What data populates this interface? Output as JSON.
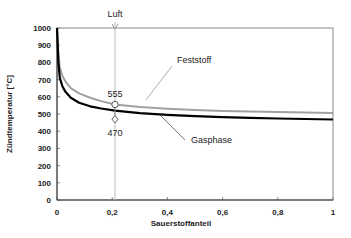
{
  "chart_data": {
    "type": "line",
    "title": "",
    "xlabel": "Sauerstoffanteil",
    "ylabel": "Zündtemperatur [°C]",
    "xlim": [
      0,
      1
    ],
    "ylim": [
      0,
      1000
    ],
    "x_ticks": [
      "0",
      "0,2",
      "0,4",
      "0,6",
      "0,8",
      "1"
    ],
    "y_ticks": [
      "0",
      "100",
      "200",
      "300",
      "400",
      "500",
      "600",
      "700",
      "800",
      "900",
      "1000"
    ],
    "grid": false,
    "series": [
      {
        "name": "Feststoff",
        "color": "#a0a0a0",
        "x": [
          0,
          0.005,
          0.01,
          0.02,
          0.03,
          0.05,
          0.08,
          0.12,
          0.16,
          0.21,
          0.3,
          0.4,
          0.5,
          0.6,
          0.7,
          0.8,
          0.9,
          1.0
        ],
        "y": [
          1000,
          850,
          770,
          720,
          690,
          650,
          620,
          595,
          575,
          555,
          540,
          530,
          523,
          518,
          514,
          511,
          508,
          505
        ]
      },
      {
        "name": "Gasphase",
        "color": "#000000",
        "x": [
          0,
          0.005,
          0.01,
          0.02,
          0.03,
          0.05,
          0.08,
          0.12,
          0.16,
          0.21,
          0.3,
          0.4,
          0.5,
          0.6,
          0.7,
          0.8,
          0.9,
          1.0
        ],
        "y": [
          1000,
          800,
          710,
          660,
          630,
          595,
          565,
          545,
          532,
          520,
          505,
          495,
          488,
          482,
          478,
          474,
          471,
          468
        ]
      }
    ],
    "annotations": [
      {
        "text": "Luft",
        "x": 0.21,
        "type": "vertical-line"
      },
      {
        "text": "555",
        "x": 0.21,
        "y": 555,
        "marker": "circle"
      },
      {
        "text": "470",
        "x": 0.21,
        "y": 470,
        "marker": "diamond"
      },
      {
        "text": "Feststoff",
        "type": "series-label"
      },
      {
        "text": "Gasphase",
        "type": "series-label"
      }
    ],
    "legend": "inline labels with leader lines"
  },
  "labels": {
    "luft": "Luft",
    "feststoff": "Feststoff",
    "gasphase": "Gasphase",
    "v555": "555",
    "v470": "470",
    "xlabel": "Sauerstoffanteil",
    "ylabel": "Zündtemperatur [°C]"
  }
}
